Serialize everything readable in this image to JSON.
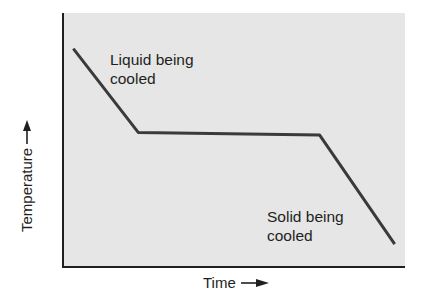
{
  "chart_data": {
    "type": "line",
    "title": "",
    "xlabel": "Time",
    "ylabel": "Temperature",
    "x_ticks": [],
    "y_ticks": [],
    "grid": false,
    "legend": null,
    "series": [
      {
        "name": "Cooling curve",
        "points": [
          {
            "x": 0.03,
            "y": 0.86
          },
          {
            "x": 0.22,
            "y": 0.53
          },
          {
            "x": 0.75,
            "y": 0.52
          },
          {
            "x": 0.97,
            "y": 0.09
          }
        ]
      }
    ],
    "annotations": [
      {
        "text": "Liquid being cooled",
        "segment": "first descending section"
      },
      {
        "text": "Solid being cooled",
        "segment": "last descending section"
      }
    ],
    "xlim": [
      0,
      1
    ],
    "ylim": [
      0,
      1
    ]
  },
  "labels": {
    "x_axis": "Time",
    "y_axis": "Temperature",
    "liquid_line1": "Liquid being",
    "liquid_line2": "cooled",
    "solid_line1": "Solid being",
    "solid_line2": "cooled"
  },
  "colors": {
    "plot_background": "#e6e6e6",
    "line": "#3a3a3a",
    "axis": "#231f20"
  }
}
